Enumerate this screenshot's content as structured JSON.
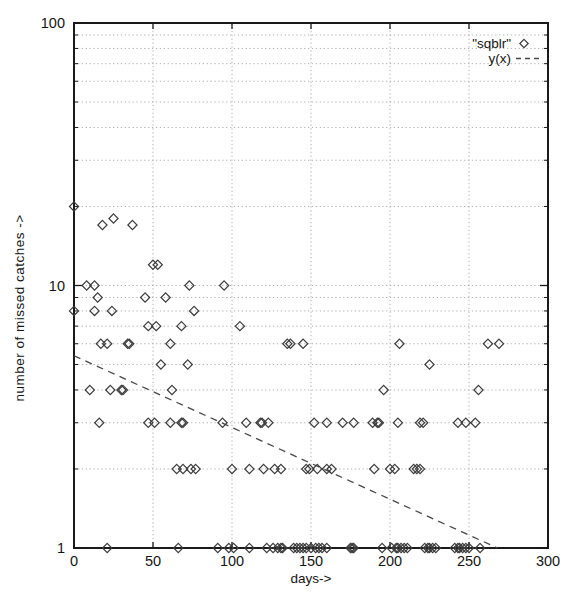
{
  "chart_data": {
    "type": "scatter",
    "title": "",
    "xlabel": "days->",
    "ylabel": "number of missed catches  ->",
    "x_axis": {
      "min": 0,
      "max": 300,
      "tick_labels": [
        "0",
        "50",
        "100",
        "150",
        "200",
        "250",
        "300"
      ],
      "ticks": [
        0,
        50,
        100,
        150,
        200,
        250,
        300
      ],
      "gridlines": [
        50,
        100,
        150,
        200,
        250
      ],
      "grid": "dotted"
    },
    "y_axis": {
      "scale": "log",
      "min": 1,
      "max": 100,
      "tick_labels": [
        "1",
        "10",
        "100"
      ],
      "major_ticks": [
        1,
        10,
        100
      ],
      "minor_gridlines": [
        2,
        3,
        4,
        5,
        6,
        7,
        8,
        9,
        10,
        20,
        30,
        40,
        50,
        60,
        70,
        80,
        90
      ],
      "grid": "dotted"
    },
    "legend": {
      "position": "top-right",
      "entries": [
        {
          "label": "\"sqblr\"",
          "sample": "diamond-marker"
        },
        {
          "label": "y(x)",
          "sample": "dashed-line"
        }
      ]
    },
    "series": [
      {
        "name": "\"sqblr\"",
        "kind": "scatter",
        "marker": "open-diamond",
        "points": [
          [
            0,
            20
          ],
          [
            18,
            17
          ],
          [
            25,
            18
          ],
          [
            37,
            17
          ],
          [
            50,
            12
          ],
          [
            53,
            12
          ],
          [
            8,
            10
          ],
          [
            13,
            10
          ],
          [
            73,
            10
          ],
          [
            95,
            10
          ],
          [
            15,
            9
          ],
          [
            45,
            9
          ],
          [
            58,
            9
          ],
          [
            0,
            8
          ],
          [
            13,
            8
          ],
          [
            24,
            8
          ],
          [
            76,
            8
          ],
          [
            47,
            7
          ],
          [
            52,
            7
          ],
          [
            68,
            7
          ],
          [
            105,
            7
          ],
          [
            17,
            6
          ],
          [
            21,
            6
          ],
          [
            34,
            6
          ],
          [
            35,
            6
          ],
          [
            61,
            6
          ],
          [
            135,
            6
          ],
          [
            137,
            6
          ],
          [
            145,
            6
          ],
          [
            206,
            6
          ],
          [
            262,
            6
          ],
          [
            269,
            6
          ],
          [
            55,
            5
          ],
          [
            72,
            5
          ],
          [
            225,
            5
          ],
          [
            10,
            4
          ],
          [
            23,
            4
          ],
          [
            30,
            4
          ],
          [
            31,
            4
          ],
          [
            62,
            4
          ],
          [
            196,
            4
          ],
          [
            256,
            4
          ],
          [
            16,
            3
          ],
          [
            47,
            3
          ],
          [
            51,
            3
          ],
          [
            61,
            3
          ],
          [
            68,
            3
          ],
          [
            69,
            3
          ],
          [
            94,
            3
          ],
          [
            109,
            3
          ],
          [
            118,
            3
          ],
          [
            119,
            3
          ],
          [
            123,
            3
          ],
          [
            152,
            3
          ],
          [
            160,
            3
          ],
          [
            170,
            3
          ],
          [
            177,
            3
          ],
          [
            189,
            3
          ],
          [
            192,
            3
          ],
          [
            193,
            3
          ],
          [
            205,
            3
          ],
          [
            219,
            3
          ],
          [
            221,
            3
          ],
          [
            243,
            3
          ],
          [
            248,
            3
          ],
          [
            254,
            3
          ],
          [
            65,
            2
          ],
          [
            69,
            2
          ],
          [
            74,
            2
          ],
          [
            77,
            2
          ],
          [
            100,
            2
          ],
          [
            111,
            2
          ],
          [
            120,
            2
          ],
          [
            127,
            2
          ],
          [
            131,
            2
          ],
          [
            147,
            2
          ],
          [
            149,
            2
          ],
          [
            154,
            2
          ],
          [
            160,
            2
          ],
          [
            163,
            2
          ],
          [
            190,
            2
          ],
          [
            200,
            2
          ],
          [
            203,
            2
          ],
          [
            215,
            2
          ],
          [
            217,
            2
          ],
          [
            219,
            2
          ],
          [
            21,
            1
          ],
          [
            66,
            1
          ],
          [
            91,
            1
          ],
          [
            98,
            1
          ],
          [
            101,
            1
          ],
          [
            111,
            1
          ],
          [
            122,
            1
          ],
          [
            126,
            1
          ],
          [
            129,
            1
          ],
          [
            131,
            1
          ],
          [
            132,
            1
          ],
          [
            139,
            1
          ],
          [
            141,
            1
          ],
          [
            143,
            1
          ],
          [
            145,
            1
          ],
          [
            147,
            1
          ],
          [
            150,
            1
          ],
          [
            153,
            1
          ],
          [
            155,
            1
          ],
          [
            157,
            1
          ],
          [
            160,
            1
          ],
          [
            175,
            1
          ],
          [
            176,
            1
          ],
          [
            177,
            1
          ],
          [
            195,
            1
          ],
          [
            201,
            1
          ],
          [
            204,
            1
          ],
          [
            205,
            1
          ],
          [
            207,
            1
          ],
          [
            209,
            1
          ],
          [
            211,
            1
          ],
          [
            222,
            1
          ],
          [
            224,
            1
          ],
          [
            225,
            1
          ],
          [
            227,
            1
          ],
          [
            229,
            1
          ],
          [
            241,
            1
          ],
          [
            243,
            1
          ],
          [
            244,
            1
          ],
          [
            246,
            1
          ],
          [
            248,
            1
          ],
          [
            250,
            1
          ],
          [
            257,
            1
          ]
        ]
      },
      {
        "name": "y(x)",
        "kind": "line",
        "style": "dashed",
        "points": [
          [
            0,
            5.4
          ],
          [
            268,
            1
          ]
        ]
      }
    ],
    "colors": {
      "background": "#ffffff",
      "axis": "#1a1a1a",
      "grid": "#a9a9a9",
      "marker": "#3c3c3c",
      "trend": "#474747",
      "text": "#141414"
    }
  }
}
